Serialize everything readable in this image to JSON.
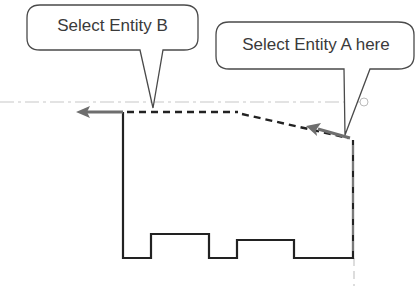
{
  "callouts": {
    "entity_b": {
      "label": "Select Entity B"
    },
    "entity_a": {
      "label": "Select Entity A here"
    }
  },
  "colors": {
    "profile": "#222222",
    "arrow": "#6e6e6e",
    "centerline": "#c8c8c8",
    "callout_border": "#4a4a4a",
    "text": "#3a3a3a"
  }
}
